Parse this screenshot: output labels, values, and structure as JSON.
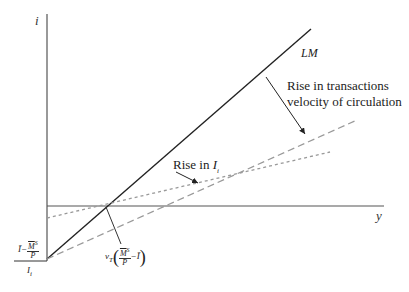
{
  "diagram": {
    "axes": {
      "y_axis_label": "i",
      "x_axis_label": "y"
    },
    "curves": {
      "lm_label": "LM",
      "lm_color": "#222222",
      "dashed_color": "#999999",
      "axis_color": "#555555"
    },
    "annotations": {
      "velocity_line1": "Rise in transactions",
      "velocity_line2": "velocity of circulation",
      "rise_in": "Rise in ",
      "rise_var": "I",
      "rise_sub": "i"
    },
    "intercept_label": {
      "ibar": "Ī",
      "minus": "−",
      "numerator": "M",
      "numerator_sup": "S",
      "denominator": "P",
      "divisor": "I",
      "divisor_sub": "i"
    },
    "x_intercept_label": {
      "v": "v",
      "v_sub": "T",
      "numerator": "M",
      "numerator_sup": "S",
      "denominator": "P",
      "minus": "−",
      "ibar": "Ī"
    }
  }
}
